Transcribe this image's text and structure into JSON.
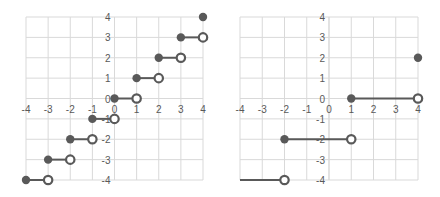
{
  "chart_data": [
    {
      "type": "scatter",
      "title": "",
      "xlabel": "",
      "ylabel": "",
      "xlim": [
        -4,
        4
      ],
      "ylim": [
        -4,
        4
      ],
      "grid": true,
      "x_ticks": [
        "-4",
        "-3",
        "-2",
        "-1",
        "0",
        "1",
        "2",
        "3",
        "4"
      ],
      "y_ticks": [
        "-4",
        "-3",
        "-2",
        "-1",
        "0",
        "1",
        "2",
        "3",
        "4"
      ],
      "description": "Step function (floor): closed dot at left endpoint, open dot at right endpoint",
      "segments": [
        {
          "x1": -4,
          "x2": -3,
          "y": -4,
          "left": "closed",
          "right": "open"
        },
        {
          "x1": -3,
          "x2": -2,
          "y": -3,
          "left": "closed",
          "right": "open"
        },
        {
          "x1": -2,
          "x2": -1,
          "y": -2,
          "left": "closed",
          "right": "open"
        },
        {
          "x1": -1,
          "x2": 0,
          "y": -1,
          "left": "closed",
          "right": "open"
        },
        {
          "x1": 0,
          "x2": 1,
          "y": 0,
          "left": "closed",
          "right": "open"
        },
        {
          "x1": 1,
          "x2": 2,
          "y": 1,
          "left": "closed",
          "right": "open"
        },
        {
          "x1": 2,
          "x2": 3,
          "y": 2,
          "left": "closed",
          "right": "open"
        },
        {
          "x1": 3,
          "x2": 4,
          "y": 3,
          "left": "closed",
          "right": "open"
        }
      ],
      "points": [
        {
          "x": 4,
          "y": 4,
          "style": "closed"
        }
      ]
    },
    {
      "type": "scatter",
      "title": "",
      "xlabel": "",
      "ylabel": "",
      "xlim": [
        -4,
        4
      ],
      "ylim": [
        -4,
        4
      ],
      "grid": true,
      "x_ticks": [
        "-4",
        "-3",
        "-2",
        "-1",
        "0",
        "1",
        "2",
        "3",
        "4"
      ],
      "y_ticks": [
        "-4",
        "-3",
        "-2",
        "-1",
        "0",
        "1",
        "2",
        "3",
        "4"
      ],
      "description": "Step function with steps of 3 units: closed dot at left endpoint, open dot at right endpoint",
      "segments": [
        {
          "x1": -4,
          "x2": -2,
          "y": -4,
          "left": "none",
          "right": "open"
        },
        {
          "x1": -2,
          "x2": 1,
          "y": -2,
          "left": "closed",
          "right": "open"
        },
        {
          "x1": 1,
          "x2": 4,
          "y": 0,
          "left": "closed",
          "right": "open"
        }
      ],
      "points": [
        {
          "x": 4,
          "y": 2,
          "style": "closed"
        }
      ]
    }
  ]
}
